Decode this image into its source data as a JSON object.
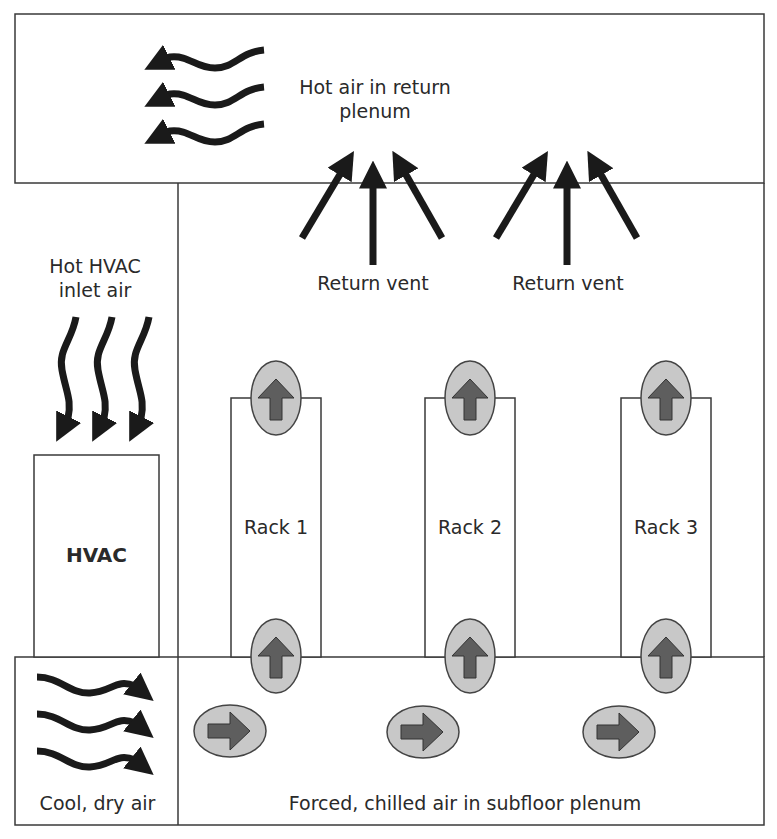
{
  "diagram": {
    "title": "",
    "type": "data-center-airflow",
    "colors": {
      "line": "#3a3a3a",
      "arrow": "#1a1a1a",
      "oval_fill": "#c8c8c8",
      "oval_arrow_fill": "#5e5e5e",
      "background": "#ffffff"
    },
    "labels": {
      "return_plenum_line1": "Hot air in return",
      "return_plenum_line2": "plenum",
      "return_vent_1": "Return vent",
      "return_vent_2": "Return vent",
      "hvac_inlet_line1": "Hot HVAC",
      "hvac_inlet_line2": "inlet air",
      "hvac_unit": "HVAC",
      "rack_1": "Rack 1",
      "rack_2": "Rack 2",
      "rack_3": "Rack 3",
      "cool_air": "Cool, dry air",
      "subfloor": "Forced, chilled air in subfloor plenum"
    },
    "icons": {
      "wavy_arrow_left": "wavy-arrow-left-icon",
      "wavy_arrow_down": "wavy-arrow-down-icon",
      "wavy_arrow_right": "wavy-arrow-right-icon",
      "straight_arrow_up": "arrow-up-icon",
      "oval_arrow_up": "oval-arrow-up-icon",
      "oval_arrow_right": "oval-arrow-right-icon"
    }
  }
}
